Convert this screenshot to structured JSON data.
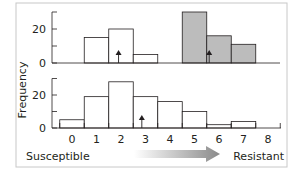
{
  "chart_data": [
    {
      "type": "bar",
      "panel": "top",
      "title": "",
      "xlabel": "",
      "ylabel": "Frequency",
      "categories": [
        "0",
        "1",
        "2",
        "3",
        "4",
        "5",
        "6",
        "7",
        "8"
      ],
      "series": [
        {
          "name": "susceptible population",
          "values": [
            0,
            15,
            20,
            5,
            0,
            0,
            0,
            0,
            0
          ],
          "fill": "#ffffff"
        },
        {
          "name": "resistant population",
          "values": [
            0,
            0,
            0,
            0,
            0,
            30,
            16,
            11,
            0
          ],
          "fill": "#bcbcbc"
        }
      ],
      "yticks": [
        0,
        10,
        20,
        30
      ],
      "ytick_labels": [
        "0",
        "",
        "20",
        ""
      ],
      "ylim": [
        0,
        30
      ],
      "mean_arrows": [
        1.9,
        5.6
      ]
    },
    {
      "type": "bar",
      "panel": "bottom",
      "title": "",
      "xlabel": "",
      "ylabel": "Frequency",
      "categories": [
        "0",
        "1",
        "2",
        "3",
        "4",
        "5",
        "6",
        "7",
        "8"
      ],
      "series": [
        {
          "name": "mixed population",
          "values": [
            5,
            19,
            28,
            19,
            16,
            10,
            2,
            4,
            0
          ],
          "fill": "#ffffff"
        }
      ],
      "yticks": [
        0,
        10,
        20,
        30
      ],
      "ytick_labels": [
        "0",
        "",
        "20",
        ""
      ],
      "ylim": [
        0,
        30
      ],
      "mean_arrows": [
        2.85
      ]
    }
  ],
  "axis": {
    "ylabel": "Frequency",
    "xticks": [
      "0",
      "1",
      "2",
      "3",
      "4",
      "5",
      "6",
      "7",
      "8"
    ],
    "ytick_0": "0",
    "ytick_20": "20"
  },
  "annotation": {
    "left_label": "Susceptible",
    "right_label": "Resistant",
    "arrow_color": "#8a8a8a"
  },
  "colors": {
    "resistant_fill": "#bcbcbc",
    "frame": "#c8c8c8",
    "line": "#231f20"
  }
}
